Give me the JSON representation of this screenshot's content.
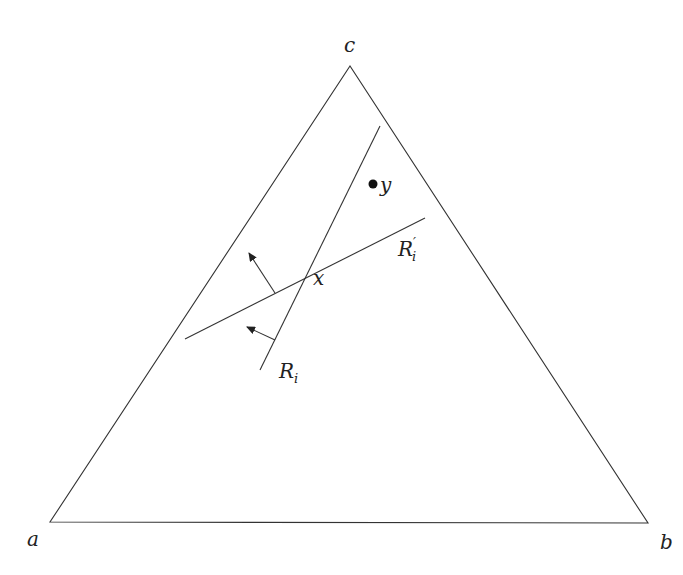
{
  "diagram": {
    "type": "triangle-with-lines",
    "colors": {
      "stroke": "#333333",
      "text": "#222222",
      "background": "#ffffff"
    },
    "vertices": {
      "a": {
        "label": "a",
        "x": 50,
        "y": 522
      },
      "b": {
        "label": "b",
        "x": 648,
        "y": 523
      },
      "c": {
        "label": "c",
        "x": 350,
        "y": 66
      }
    },
    "lines": {
      "R_i": {
        "label": "R",
        "subscript": "i",
        "prime": "",
        "x1": 260,
        "y1": 370,
        "x2": 380,
        "y2": 126
      },
      "R_i_prime": {
        "label": "R",
        "subscript": "i",
        "prime": "′",
        "x1": 185,
        "y1": 339,
        "x2": 425,
        "y2": 218
      }
    },
    "arrows": [
      {
        "name": "normal-arrow-R-i-prime",
        "from_x": 275,
        "from_y": 293,
        "to_x": 248,
        "to_y": 252
      },
      {
        "name": "normal-arrow-R-i",
        "from_x": 275,
        "from_y": 340,
        "to_x": 246,
        "to_y": 327
      }
    ],
    "points": {
      "x": {
        "label": "x",
        "x": 303,
        "y": 280
      },
      "y": {
        "label": "y",
        "x": 373,
        "y": 184
      }
    }
  }
}
